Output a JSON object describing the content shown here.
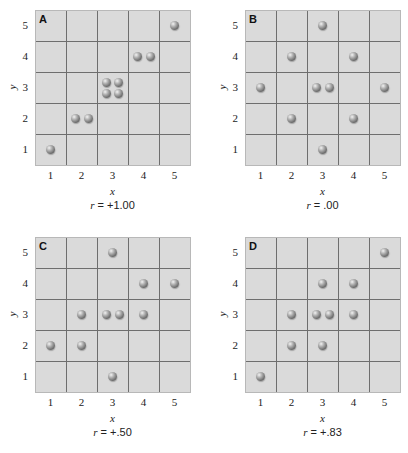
{
  "figure": {
    "panels": [
      {
        "letter": "A",
        "r_symbol": "r",
        "r_text": " = +1.00"
      },
      {
        "letter": "B",
        "r_symbol": "r",
        "r_text": " = .00"
      },
      {
        "letter": "C",
        "r_symbol": "r",
        "r_text": " = +.50"
      },
      {
        "letter": "D",
        "r_symbol": "r",
        "r_text": " = +.83"
      }
    ],
    "xlabel": "x",
    "ylabel": "y",
    "ticks": [
      "1",
      "2",
      "3",
      "4",
      "5"
    ],
    "colors": {
      "cell_bg": "#dadada",
      "grid_line": "#6e6e6e",
      "ball": "#7a7a7a"
    }
  },
  "chart_data": [
    {
      "type": "scatter",
      "title": "A",
      "annotation": "r = +1.00",
      "xlabel": "x",
      "ylabel": "y",
      "xlim": [
        0.5,
        5.5
      ],
      "ylim": [
        0.5,
        5.5
      ],
      "grid": true,
      "points": [
        [
          1,
          1
        ],
        [
          2,
          2
        ],
        [
          2,
          2
        ],
        [
          3,
          3
        ],
        [
          3,
          3
        ],
        [
          3,
          3
        ],
        [
          3,
          3
        ],
        [
          4,
          4
        ],
        [
          4,
          4
        ],
        [
          5,
          5
        ]
      ]
    },
    {
      "type": "scatter",
      "title": "B",
      "annotation": "r = .00",
      "xlabel": "x",
      "ylabel": "y",
      "xlim": [
        0.5,
        5.5
      ],
      "ylim": [
        0.5,
        5.5
      ],
      "grid": true,
      "points": [
        [
          3,
          5
        ],
        [
          2,
          4
        ],
        [
          4,
          4
        ],
        [
          1,
          3
        ],
        [
          3,
          3
        ],
        [
          3,
          3
        ],
        [
          5,
          3
        ],
        [
          2,
          2
        ],
        [
          4,
          2
        ],
        [
          3,
          1
        ]
      ]
    },
    {
      "type": "scatter",
      "title": "C",
      "annotation": "r = +.50",
      "xlabel": "x",
      "ylabel": "y",
      "xlim": [
        0.5,
        5.5
      ],
      "ylim": [
        0.5,
        5.5
      ],
      "grid": true,
      "points": [
        [
          3,
          5
        ],
        [
          4,
          4
        ],
        [
          5,
          4
        ],
        [
          2,
          3
        ],
        [
          3,
          3
        ],
        [
          3,
          3
        ],
        [
          4,
          3
        ],
        [
          1,
          2
        ],
        [
          2,
          2
        ],
        [
          3,
          1
        ]
      ]
    },
    {
      "type": "scatter",
      "title": "D",
      "annotation": "r = +.83",
      "xlabel": "x",
      "ylabel": "y",
      "xlim": [
        0.5,
        5.5
      ],
      "ylim": [
        0.5,
        5.5
      ],
      "grid": true,
      "points": [
        [
          5,
          5
        ],
        [
          3,
          4
        ],
        [
          4,
          4
        ],
        [
          2,
          3
        ],
        [
          3,
          3
        ],
        [
          3,
          3
        ],
        [
          4,
          3
        ],
        [
          2,
          2
        ],
        [
          3,
          2
        ],
        [
          1,
          1
        ]
      ]
    }
  ]
}
